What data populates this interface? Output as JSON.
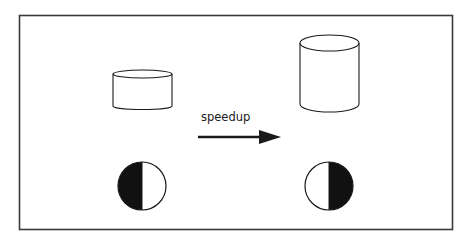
{
  "diagram": {
    "arrow_label": "speedup",
    "before": {
      "container_shape": "short-cylinder",
      "indicator": "half-circle-left-filled"
    },
    "after": {
      "container_shape": "tall-cylinder",
      "indicator": "half-circle-right-filled"
    },
    "colors": {
      "stroke": "#1a1a1a",
      "fill": "#111111",
      "background": "#ffffff",
      "frame": "#3a3a3a"
    }
  }
}
